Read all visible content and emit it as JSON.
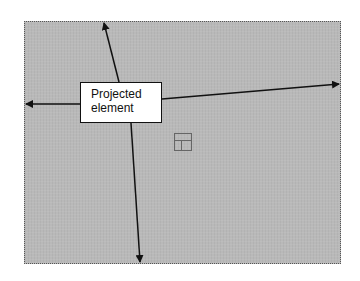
{
  "diagram": {
    "label": {
      "line1": "Projected",
      "line2": "element"
    },
    "arrows": [
      {
        "direction": "up",
        "from": [
          119,
          82
        ],
        "to": [
          103,
          21
        ]
      },
      {
        "direction": "left",
        "from": [
          80,
          104
        ],
        "to": [
          24,
          104
        ]
      },
      {
        "direction": "right",
        "from": [
          162,
          99
        ],
        "to": [
          341,
          84
        ]
      },
      {
        "direction": "down",
        "from": [
          131,
          123
        ],
        "to": [
          140,
          264
        ]
      }
    ],
    "colors": {
      "background": "#b9b9b9",
      "arrow": "#111111",
      "label_fill": "#ffffff"
    }
  }
}
